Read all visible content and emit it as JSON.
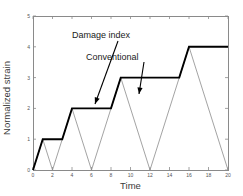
{
  "chart_data": {
    "type": "line",
    "title": "",
    "xlabel": "Time",
    "ylabel": "Normalized strain",
    "xlim": [
      0,
      20
    ],
    "ylim": [
      0,
      5
    ],
    "xticks": [
      0,
      2,
      4,
      6,
      8,
      10,
      12,
      14,
      16,
      18,
      20
    ],
    "yticks": [
      0,
      1,
      2,
      3,
      4,
      5
    ],
    "xtick_labels": [
      "0",
      "2",
      "4",
      "6",
      "8",
      "10",
      "12",
      "14",
      "16",
      "18",
      "20"
    ],
    "ytick_labels": [
      "0",
      "1",
      "2",
      "3",
      "4",
      "5"
    ],
    "grid": false,
    "legend_position": "none",
    "annotations": [
      {
        "label": "Damage index",
        "text_x": 118,
        "text_y": 30,
        "arrow_from": [
          118,
          41
        ],
        "arrow_to": [
          95,
          104
        ]
      },
      {
        "label": "Conventional",
        "text_x": 141,
        "text_y": 52,
        "arrow_from": [
          144,
          62
        ],
        "arrow_to": [
          139,
          94
        ]
      }
    ],
    "series": [
      {
        "name": "Damage index",
        "style": "thick-black",
        "color": "#000000",
        "linewidth": 1.9,
        "x": [
          0,
          1,
          3,
          4,
          8,
          9,
          15,
          16,
          20
        ],
        "y": [
          0,
          1,
          1,
          2,
          2,
          3,
          3,
          4,
          4
        ]
      },
      {
        "name": "Conventional",
        "style": "thin-gray",
        "color": "#8c8c8c",
        "linewidth": 0.8,
        "x": [
          0,
          1,
          2,
          4,
          6,
          9,
          12,
          16,
          20
        ],
        "y": [
          0,
          1,
          0,
          2,
          0,
          3,
          0,
          4,
          0
        ]
      }
    ]
  },
  "axes": {
    "plot_left": 33,
    "plot_right": 228,
    "plot_top": 16,
    "plot_bottom": 170,
    "frame_color": "#8a8a8a"
  }
}
